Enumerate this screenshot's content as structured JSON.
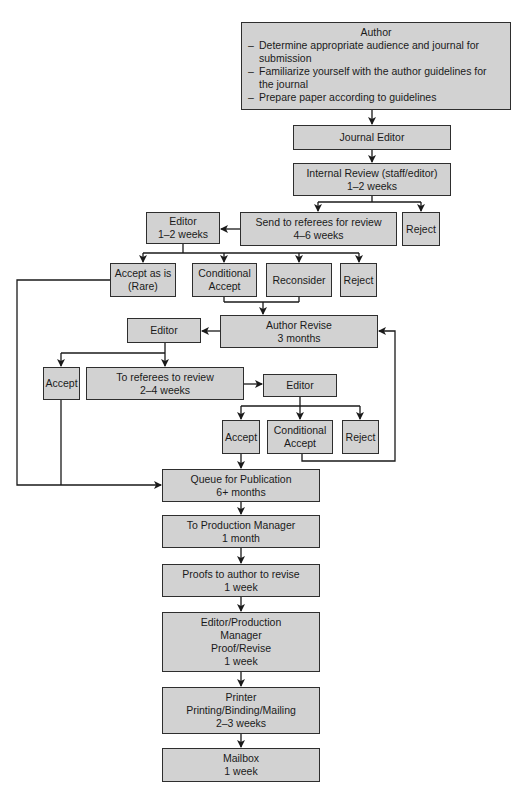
{
  "colors": {
    "box_fill": "#d2d2d2",
    "box_border": "#2e2e2e",
    "line": "#1a1a1a",
    "background": "#ffffff"
  },
  "nodes": {
    "author": {
      "title": "Author",
      "bullets": [
        "Determine appropriate audience and journal for submission",
        "Familiarize yourself with the author guidelines for the journal",
        "Prepare paper according to guidelines"
      ]
    },
    "journal_editor": {
      "lines": [
        "Journal Editor"
      ]
    },
    "internal_review": {
      "lines": [
        "Internal Review (staff/editor)",
        "1–2 weeks"
      ]
    },
    "send_to_referees": {
      "lines": [
        "Send to referees for review",
        "4–6 weeks"
      ]
    },
    "reject_1": {
      "lines": [
        "Reject"
      ]
    },
    "editor_1": {
      "lines": [
        "Editor",
        "1–2 weeks"
      ]
    },
    "accept_as_is": {
      "lines": [
        "Accept as is",
        "(Rare)"
      ]
    },
    "conditional_accept_1": {
      "lines": [
        "Conditional",
        "Accept"
      ]
    },
    "reconsider": {
      "lines": [
        "Reconsider"
      ]
    },
    "reject_2": {
      "lines": [
        "Reject"
      ]
    },
    "author_revise": {
      "lines": [
        "Author Revise",
        "3 months"
      ]
    },
    "editor_2": {
      "lines": [
        "Editor"
      ]
    },
    "accept_1": {
      "lines": [
        "Accept"
      ]
    },
    "to_referees_review": {
      "lines": [
        "To referees to review",
        "2–4 weeks"
      ]
    },
    "editor_3": {
      "lines": [
        "Editor"
      ]
    },
    "accept_2": {
      "lines": [
        "Accept"
      ]
    },
    "conditional_accept_2": {
      "lines": [
        "Conditional",
        "Accept"
      ]
    },
    "reject_3": {
      "lines": [
        "Reject"
      ]
    },
    "queue_publication": {
      "lines": [
        "Queue for Publication",
        "6+ months"
      ]
    },
    "production_manager": {
      "lines": [
        "To Production Manager",
        "1 month"
      ]
    },
    "proofs_author": {
      "lines": [
        "Proofs to author to revise",
        "1 week"
      ]
    },
    "editor_production": {
      "lines": [
        "Editor/Production",
        "Manager",
        "Proof/Revise",
        "1 week"
      ]
    },
    "printer": {
      "lines": [
        "Printer",
        "Printing/Binding/Mailing",
        "2–3 weeks"
      ]
    },
    "mailbox": {
      "lines": [
        "Mailbox",
        "1 week"
      ]
    }
  },
  "edges": [
    [
      "author",
      "journal_editor"
    ],
    [
      "journal_editor",
      "internal_review"
    ],
    [
      "internal_review",
      "send_to_referees"
    ],
    [
      "internal_review",
      "reject_1"
    ],
    [
      "send_to_referees",
      "editor_1"
    ],
    [
      "editor_1",
      "accept_as_is"
    ],
    [
      "editor_1",
      "conditional_accept_1"
    ],
    [
      "editor_1",
      "reconsider"
    ],
    [
      "editor_1",
      "reject_2"
    ],
    [
      "conditional_accept_1",
      "author_revise"
    ],
    [
      "reconsider",
      "author_revise"
    ],
    [
      "author_revise",
      "editor_2"
    ],
    [
      "editor_2",
      "accept_1"
    ],
    [
      "editor_2",
      "to_referees_review"
    ],
    [
      "to_referees_review",
      "editor_3"
    ],
    [
      "editor_3",
      "accept_2"
    ],
    [
      "editor_3",
      "conditional_accept_2"
    ],
    [
      "editor_3",
      "reject_3"
    ],
    [
      "conditional_accept_2",
      "author_revise"
    ],
    [
      "accept_2",
      "queue_publication"
    ],
    [
      "accept_1",
      "queue_publication"
    ],
    [
      "accept_as_is",
      "queue_publication"
    ],
    [
      "queue_publication",
      "production_manager"
    ],
    [
      "production_manager",
      "proofs_author"
    ],
    [
      "proofs_author",
      "editor_production"
    ],
    [
      "editor_production",
      "printer"
    ],
    [
      "printer",
      "mailbox"
    ]
  ]
}
